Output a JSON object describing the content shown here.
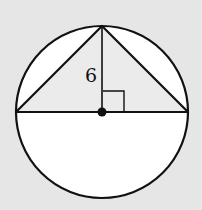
{
  "figure": {
    "type": "circle-inscribed-triangle",
    "height_label": "6",
    "colors": {
      "background": "#e6e6e6",
      "triangle_fill": "#ebebeb",
      "segment_fill": "#ffffff",
      "stroke": "#111111"
    },
    "center": {
      "x": 102,
      "y": 112
    },
    "radius": 86
  }
}
